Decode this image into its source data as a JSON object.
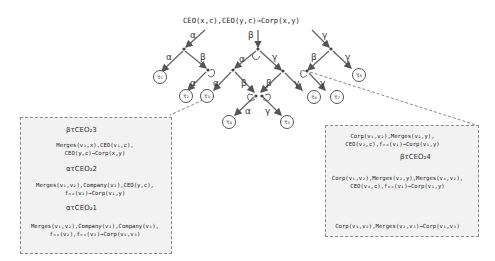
{
  "root_rule": "CEO(x,c),CEO(y,c)→Corp(x,y)",
  "edge_labels": {
    "root_left": "α",
    "root_mid": "β",
    "root_right": "γ",
    "l_a": "α",
    "l_b": "β",
    "l2_a": "α",
    "m_a": "α",
    "m_g": "γ",
    "m2_a": "α",
    "m2_b": "β",
    "r_b": "β",
    "r_g": "γ",
    "r2_g": "γ",
    "mm_b": "β",
    "mm_g": "γ",
    "c_a": "α",
    "c_g": "γ"
  },
  "leaves": [
    "τ₁",
    "τ₂",
    "τ₃",
    "τ₄",
    "τ₅",
    "τ₆",
    "τ₇",
    "τ₈"
  ],
  "left_box": {
    "step1": "βτCEO₂3",
    "expr1_line1": "Merges(v₁,x),CEO(v₁,c),",
    "expr1_line2": "CEO(y,c)→Corp(x,y)",
    "step2": "ατCEO₂2",
    "expr2_line1": "Merges(v₁,v₂),Company(v₂),CEO(y,c),",
    "expr2_line2": "fₙₒ(v₂)→Corp(v₁,y)",
    "step3": "ατCEO₂1",
    "expr3_line1": "Merges(v₁,v₂),Company(v₂),Company(v₃),",
    "expr3_line2": "fₙₒ(v₂),fₙₒ(v₃)→Corp(v₁,v₃)"
  },
  "right_box": {
    "expr1_line1": "Corp(v₁,v₂),Merges(v₂,y),",
    "expr1_line2": "CEO(v₂,c),fₙₒ(v₁)→Corp(v₁,y)",
    "step1": "βτCEO₂4",
    "expr2_line1": "Corp(v₁,v₂),Merges(v₂,y),Merges(v₄,v₂),",
    "expr2_line2": "CEO(v₄,c),fₙₒ(v₁)→Corp(v₁,y)",
    "expr3": "Corp(v₁,v₂),Merges(v₂,v₃)→Corp(v₁,v₃)"
  }
}
